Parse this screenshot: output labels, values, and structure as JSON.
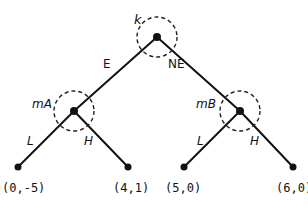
{
  "diagram": {
    "type": "game-tree",
    "root": {
      "label": "k",
      "x": 157,
      "y": 37,
      "info_set_radius": 20,
      "actions": [
        "E",
        "NE"
      ]
    },
    "nodes": [
      {
        "id": "mA",
        "label": "mA",
        "x": 74,
        "y": 111,
        "info_set_radius": 20,
        "actions": [
          "L",
          "H"
        ]
      },
      {
        "id": "mB",
        "label": "mB",
        "x": 240,
        "y": 111,
        "info_set_radius": 20,
        "actions": [
          "L",
          "H"
        ]
      }
    ],
    "edges": [
      {
        "from": "k",
        "to": "mA",
        "label": "E"
      },
      {
        "from": "k",
        "to": "mB",
        "label": "NE"
      },
      {
        "from": "mA",
        "to": "leaf1",
        "label": "L"
      },
      {
        "from": "mA",
        "to": "leaf2",
        "label": "H"
      },
      {
        "from": "mB",
        "to": "leaf3",
        "label": "L"
      },
      {
        "from": "mB",
        "to": "leaf4",
        "label": "H"
      }
    ],
    "leaves": [
      {
        "id": "leaf1",
        "payoff": "(0,-5)",
        "x": 18,
        "y": 167
      },
      {
        "id": "leaf2",
        "payoff": "(4,1)",
        "x": 128,
        "y": 167
      },
      {
        "id": "leaf3",
        "payoff": "(5,0)",
        "x": 184,
        "y": 167
      },
      {
        "id": "leaf4",
        "payoff": "(6,0)",
        "x": 293,
        "y": 167
      }
    ],
    "labels": {
      "root": "k",
      "edge_left": "E",
      "edge_right": "NE",
      "node_left": "mA",
      "node_right": "mB",
      "left_L": "L",
      "left_H": "H",
      "right_L": "L",
      "right_H": "H",
      "payoff_1": "(0,-5)",
      "payoff_2": "(4,1)",
      "payoff_3": "(5,0)",
      "payoff_4": "(6,0)"
    },
    "colors": {
      "line": "#111111",
      "background": "#ffffff"
    }
  }
}
